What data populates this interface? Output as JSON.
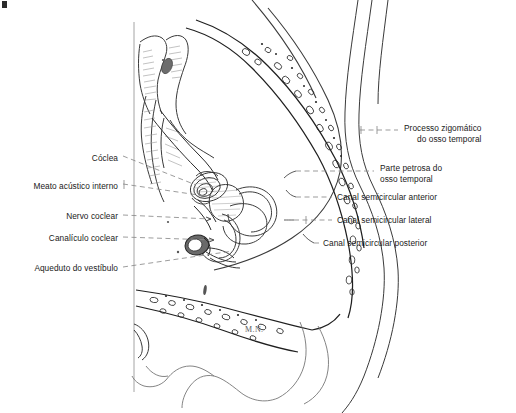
{
  "figure": {
    "signature": "M.N.",
    "background_color": "#ffffff",
    "ink_color": "#1a1a1a",
    "leader_color": "#8a8a8a"
  },
  "labels_left": [
    {
      "id": "coclea",
      "text": "Cóclea",
      "x": 118,
      "y": 153,
      "leader_to_x": 196,
      "leader_to_y": 186
    },
    {
      "id": "meato-acustico",
      "text": "Meato acústico interno",
      "x": 118,
      "y": 181,
      "leader_to_x": 205,
      "leader_to_y": 196
    },
    {
      "id": "nervo-coclear",
      "text": "Nervo coclear",
      "x": 118,
      "y": 212,
      "leader_to_x": 210,
      "leader_to_y": 219
    },
    {
      "id": "canaliculo-coclear",
      "text": "Canalículo coclear",
      "x": 118,
      "y": 234,
      "leader_to_x": 213,
      "leader_to_y": 239
    },
    {
      "id": "aqueduto-vestibulo",
      "text": "Aqueduto do vestíbulo",
      "x": 118,
      "y": 264,
      "leader_to_x": 231,
      "leader_to_y": 251
    }
  ],
  "labels_right": [
    {
      "id": "processo-zigomatico",
      "line1": "Processo zigomático",
      "line2": "do osso temporal",
      "x": 404,
      "y": 124,
      "leader_from_x": 355,
      "leader_from_y": 130
    },
    {
      "id": "parte-petrosa",
      "line1": "Parte petrosa do",
      "line2": "osso temporal",
      "x": 380,
      "y": 164,
      "leader_from_x": 300,
      "leader_from_y": 171
    },
    {
      "id": "canal-anterior",
      "line1": "Canal semicircular anterior",
      "line2": "",
      "x": 337,
      "y": 193,
      "leader_from_x": 298,
      "leader_from_y": 197
    },
    {
      "id": "canal-lateral",
      "line1": "Canal semicircular lateral",
      "line2": "",
      "x": 337,
      "y": 216,
      "leader_from_x": 295,
      "leader_from_y": 220
    },
    {
      "id": "canal-posterior",
      "line1": "Canal semicircular posterior",
      "line2": "",
      "x": 323,
      "y": 239,
      "leader_from_x": 312,
      "leader_from_y": 243
    }
  ]
}
